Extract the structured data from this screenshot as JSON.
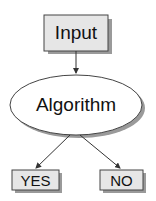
{
  "diagram": {
    "nodes": [
      {
        "id": "input",
        "label": "Input",
        "shape": "rectangle"
      },
      {
        "id": "algorithm",
        "label": "Algorithm",
        "shape": "ellipse"
      },
      {
        "id": "yes",
        "label": "YES",
        "shape": "rectangle"
      },
      {
        "id": "no",
        "label": "NO",
        "shape": "rectangle"
      }
    ],
    "edges": [
      {
        "from": "input",
        "to": "algorithm"
      },
      {
        "from": "algorithm",
        "to": "yes"
      },
      {
        "from": "algorithm",
        "to": "no"
      }
    ],
    "colors": {
      "box_fill": "#e6e6e6",
      "ellipse_fill": "#ffffff",
      "stroke": "#333333",
      "shadow": "#9a9a9a"
    }
  }
}
